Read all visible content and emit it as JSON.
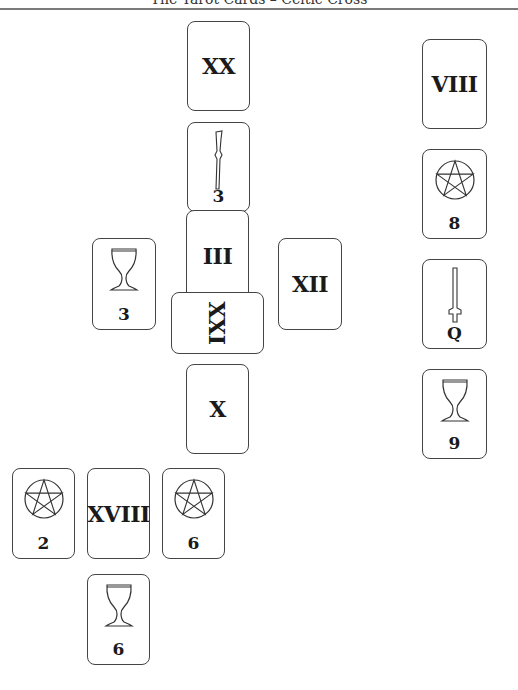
{
  "header": {
    "title": "The Tarot Cards – Celtic Cross"
  },
  "spread": {
    "cards": [
      {
        "id": "crown",
        "type": "major",
        "label": "XX",
        "x": 187,
        "y": 21,
        "w": 63,
        "h": 90
      },
      {
        "id": "root",
        "type": "minor",
        "suit": "wands",
        "label": "3",
        "x": 187,
        "y": 122,
        "w": 63,
        "h": 90
      },
      {
        "id": "cover",
        "type": "major",
        "label": "III",
        "x": 186,
        "y": 210,
        "w": 63,
        "h": 92
      },
      {
        "id": "cross",
        "type": "major",
        "label": "XXI",
        "rotated": true,
        "x": 171,
        "y": 292,
        "w": 93,
        "h": 62
      },
      {
        "id": "past",
        "type": "minor",
        "suit": "cups",
        "label": "3",
        "x": 92,
        "y": 238,
        "w": 64,
        "h": 92
      },
      {
        "id": "future",
        "type": "major",
        "label": "XII",
        "x": 278,
        "y": 238,
        "w": 64,
        "h": 92
      },
      {
        "id": "below",
        "type": "major",
        "label": "X",
        "x": 186,
        "y": 364,
        "w": 63,
        "h": 90
      },
      {
        "id": "staff-1",
        "type": "major",
        "label": "VIII",
        "x": 422,
        "y": 39,
        "w": 65,
        "h": 90
      },
      {
        "id": "staff-2",
        "type": "minor",
        "suit": "pentacles",
        "label": "8",
        "x": 422,
        "y": 149,
        "w": 65,
        "h": 90
      },
      {
        "id": "staff-3",
        "type": "minor",
        "suit": "swords",
        "label": "Q",
        "x": 422,
        "y": 259,
        "w": 65,
        "h": 90
      },
      {
        "id": "staff-4",
        "type": "minor",
        "suit": "cups",
        "label": "9",
        "x": 422,
        "y": 369,
        "w": 65,
        "h": 90
      },
      {
        "id": "row-1",
        "type": "minor",
        "suit": "pentacles",
        "label": "2",
        "x": 12,
        "y": 468,
        "w": 63,
        "h": 91
      },
      {
        "id": "row-2",
        "type": "major",
        "label": "XVIII",
        "x": 87,
        "y": 468,
        "w": 63,
        "h": 91
      },
      {
        "id": "row-3",
        "type": "minor",
        "suit": "pentacles",
        "label": "6",
        "x": 162,
        "y": 468,
        "w": 63,
        "h": 91
      },
      {
        "id": "row-4",
        "type": "minor",
        "suit": "cups",
        "label": "6",
        "x": 87,
        "y": 574,
        "w": 63,
        "h": 91
      }
    ]
  },
  "icons": {
    "cups": "cup-icon",
    "wands": "wand-icon",
    "swords": "sword-icon",
    "pentacles": "pentacle-icon"
  }
}
